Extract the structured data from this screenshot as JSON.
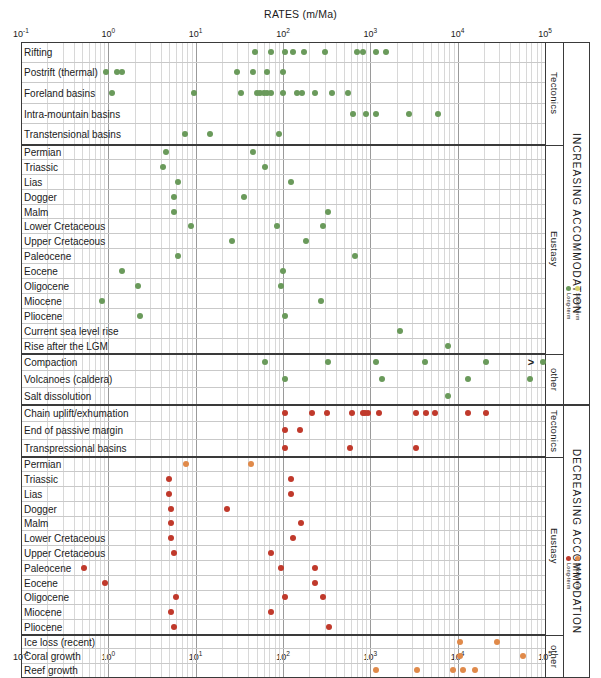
{
  "chart_data": {
    "type": "scatter",
    "title": "RATES (m/Ma)",
    "xlabel": "RATES (m/Ma)",
    "ylabel": "",
    "xscale": "log",
    "xlim": [
      0.1,
      100000
    ],
    "xticks": [
      "10-1",
      "100",
      "101",
      "102",
      "103",
      "104",
      "105"
    ],
    "xtick_labels": [
      "10⁻¹",
      "10⁰",
      "10¹",
      "10²",
      "10³",
      "10⁴",
      "10⁵"
    ],
    "grid": true,
    "legend_position": "right",
    "colors": {
      "increasing_long": "#6a9a5b",
      "increasing_short": "#d9d36a",
      "decreasing_long": "#c0392b",
      "decreasing_short": "#e08a4a",
      "frame": "#3a3a3a",
      "grid": "#d8d8d8"
    },
    "sections": [
      {
        "name": "INCREASING ACCOMMODATION",
        "group_label_top": "Tectonics",
        "rows": [
          {
            "label": "Rifting",
            "group": "Tectonics",
            "values": [
              48,
              72,
              105,
              130,
              175,
              300,
              700,
              820,
              1150,
              1500
            ],
            "color": "#6a9a5b"
          },
          {
            "label": "Postrift (thermal)",
            "group": "Tectonics",
            "values": [
              0.95,
              1.25,
              1.45,
              30,
              45,
              66,
              100
            ],
            "color": "#6a9a5b"
          },
          {
            "label": "Foreland basins",
            "group": "Tectonics",
            "values": [
              1.1,
              9.5,
              33,
              50,
              55,
              60,
              66,
              72,
              100,
              145,
              165,
              230,
              360,
              560
            ],
            "color": "#6a9a5b"
          },
          {
            "label": "Intra-mountain basins",
            "group": "Tectonics",
            "values": [
              640,
              900,
              1150,
              2800,
              6000
            ],
            "color": "#6a9a5b"
          },
          {
            "label": "Transtensional basins",
            "group": "Tectonics",
            "values": [
              7.5,
              14.5,
              90
            ],
            "color": "#6a9a5b"
          }
        ]
      },
      {
        "name": "INCREASING ACCOMMODATION",
        "group_label": "Eustasy",
        "rows": [
          {
            "label": "Permian",
            "group": "Eustasy",
            "values": [
              4.6,
              45
            ],
            "color": "#6a9a5b"
          },
          {
            "label": "Triassic",
            "group": "Eustasy",
            "values": [
              4.2,
              62
            ],
            "color": "#6a9a5b"
          },
          {
            "label": "Lias",
            "group": "Eustasy",
            "values": [
              6.3,
              125
            ],
            "color": "#6a9a5b"
          },
          {
            "label": "Dogger",
            "group": "Eustasy",
            "values": [
              5.7,
              36
            ],
            "color": "#6a9a5b"
          },
          {
            "label": "Malm",
            "group": "Eustasy",
            "values": [
              5.7,
              330
            ],
            "color": "#6a9a5b"
          },
          {
            "label": "Lower Cretaceous",
            "group": "Eustasy",
            "values": [
              8.8,
              86,
              290
            ],
            "color": "#6a9a5b"
          },
          {
            "label": "Upper Cretaceous",
            "group": "Eustasy",
            "values": [
              26,
              185
            ],
            "color": "#6a9a5b"
          },
          {
            "label": "Paleocene",
            "group": "Eustasy",
            "values": [
              6.3,
              660
            ],
            "color": "#6a9a5b"
          },
          {
            "label": "Eocene",
            "group": "Eustasy",
            "values": [
              1.45,
              99
            ],
            "color": "#6a9a5b"
          },
          {
            "label": "Oligocene",
            "group": "Eustasy",
            "values": [
              2.2,
              94
            ],
            "color": "#6a9a5b"
          },
          {
            "label": "Miocene",
            "group": "Eustasy",
            "values": [
              0.85,
              270
            ],
            "color": "#6a9a5b"
          },
          {
            "label": "Pliocene",
            "group": "Eustasy",
            "values": [
              2.3,
              105
            ],
            "color": "#6a9a5b"
          },
          {
            "label": "Current sea level rise",
            "group": "Eustasy",
            "values": [
              2200
            ],
            "color": "#6a9a5b"
          },
          {
            "label": "Rise after the LGM",
            "group": "Eustasy",
            "values": [
              7800
            ],
            "color": "#6a9a5b"
          }
        ]
      },
      {
        "name": "INCREASING ACCOMMODATION",
        "group_label": "other",
        "rows": [
          {
            "label": "Compaction",
            "group": "other",
            "values": [
              62,
              330,
              1150,
              4200,
              21000,
              95000
            ],
            "color": "#6a9a5b",
            "open_right": true
          },
          {
            "label": "Volcanoes (caldera)",
            "group": "other",
            "values": [
              105,
              1350,
              13000,
              68000
            ],
            "color": "#6a9a5b"
          },
          {
            "label": "Salt dissolution",
            "group": "other",
            "values": [
              7800
            ],
            "color": "#6a9a5b"
          }
        ]
      },
      {
        "name": "DECREASING ACCOMMODATION",
        "group_label": "Tectonics",
        "rows": [
          {
            "label": "Chain uplift/exhumation",
            "group": "Tectonics",
            "values": [
              105,
              215,
              320,
              620,
              820,
              880,
              930,
              1250,
              3300,
              4300,
              5500,
              13000,
              21000
            ],
            "color": "#c0392b"
          },
          {
            "label": "End of passive margin",
            "group": "Tectonics",
            "values": [
              105,
              155
            ],
            "color": "#c0392b"
          },
          {
            "label": "Transpressional basins",
            "group": "Tectonics",
            "values": [
              105,
              580,
              3300
            ],
            "color": "#c0392b"
          }
        ]
      },
      {
        "name": "DECREASING ACCOMMODATION",
        "group_label": "Eustasy",
        "rows": [
          {
            "label": "Permian",
            "group": "Eustasy",
            "values": [
              7.8,
              43
            ],
            "color": "#e08a4a"
          },
          {
            "label": "Triassic",
            "group": "Eustasy",
            "values": [
              5.0,
              125
            ],
            "color": "#c0392b"
          },
          {
            "label": "Lias",
            "group": "Eustasy",
            "values": [
              5.0,
              125
            ],
            "color": "#c0392b"
          },
          {
            "label": "Dogger",
            "group": "Eustasy",
            "values": [
              5.2,
              23
            ],
            "color": "#c0392b"
          },
          {
            "label": "Malm",
            "group": "Eustasy",
            "values": [
              5.2,
              160
            ],
            "color": "#c0392b"
          },
          {
            "label": "Lower Cretaceous",
            "group": "Eustasy",
            "values": [
              5.2,
              130
            ],
            "color": "#c0392b"
          },
          {
            "label": "Upper Cretaceous",
            "group": "Eustasy",
            "values": [
              5.7,
              72
            ],
            "color": "#c0392b"
          },
          {
            "label": "Paleocene",
            "group": "Eustasy",
            "values": [
              0.52,
              95,
              230
            ],
            "color": "#c0392b"
          },
          {
            "label": "Eocene",
            "group": "Eustasy",
            "values": [
              0.92,
              230
            ],
            "color": "#c0392b"
          },
          {
            "label": "Oligocene",
            "group": "Eustasy",
            "values": [
              6.0,
              105,
              290
            ],
            "color": "#c0392b"
          },
          {
            "label": "Miocene",
            "group": "Eustasy",
            "values": [
              5.2,
              72
            ],
            "color": "#c0392b"
          },
          {
            "label": "Pliocene",
            "group": "Eustasy",
            "values": [
              5.7,
              340
            ],
            "color": "#c0392b"
          }
        ]
      },
      {
        "name": "DECREASING ACCOMMODATION",
        "group_label": "other",
        "rows": [
          {
            "label": "Ice loss (recent)",
            "group": "other",
            "values": [
              10500,
              28000
            ],
            "color": "#e08a4a"
          },
          {
            "label": "Coral growth",
            "group": "other",
            "values": [
              10500,
              56000
            ],
            "color": "#e08a4a"
          },
          {
            "label": "Reef growth",
            "group": "other",
            "values": [
              1150,
              3400,
              8800,
              11500,
              16000
            ],
            "color": "#e08a4a"
          }
        ]
      }
    ]
  },
  "axis": {
    "title": "RATES (m/Ma)",
    "ticks": [
      {
        "label": "10",
        "exp": "-1"
      },
      {
        "label": "10",
        "exp": "0"
      },
      {
        "label": "10",
        "exp": "1"
      },
      {
        "label": "10",
        "exp": "2"
      },
      {
        "label": "10",
        "exp": "3"
      },
      {
        "label": "10",
        "exp": "4"
      },
      {
        "label": "10",
        "exp": "5"
      }
    ]
  },
  "side_labels": {
    "increasing": "INCREASING ACCOMMODATION",
    "decreasing": "DECREASING ACCOMMODATION",
    "tectonics_top": "Tectonics",
    "eustasy_top": "Eustasy",
    "other_top": "other",
    "tectonics_bottom": "Tectonics",
    "eustasy_bottom": "Eustasy",
    "other_bottom": "other"
  },
  "legend_top": {
    "short_term": "Short-term",
    "long_term": "Long-term",
    "short_color": "#d9d36a",
    "long_color": "#6a9a5b"
  },
  "legend_bottom": {
    "short_term": "Short-term",
    "long_term": "Long-term",
    "short_color": "#e08a4a",
    "long_color": "#c0392b"
  },
  "markers": {
    "open_right_symbol": ">"
  }
}
